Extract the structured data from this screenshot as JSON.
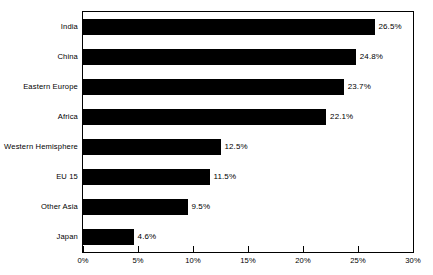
{
  "chart_data": {
    "type": "bar",
    "orientation": "horizontal",
    "title": "",
    "xlabel": "",
    "ylabel": "",
    "xlim": [
      0,
      30
    ],
    "xticks": [
      "0%",
      "5%",
      "10%",
      "15%",
      "20%",
      "25%",
      "30%"
    ],
    "xtick_values": [
      0,
      5,
      10,
      15,
      20,
      25,
      30
    ],
    "grid": false,
    "legend": null,
    "bar_color": "#000000",
    "frame_color": "#000000",
    "background": "#ffffff",
    "categories": [
      "India",
      "China",
      "Eastern Europe",
      "Africa",
      "Western Hemisphere",
      "EU 15",
      "Other Asia",
      "Japan"
    ],
    "values": [
      26.5,
      24.8,
      23.7,
      22.1,
      12.5,
      11.5,
      9.5,
      4.6
    ],
    "data_labels": [
      "26.5%",
      "24.8%",
      "23.7%",
      "22.1%",
      "12.5%",
      "11.5%",
      "9.5%",
      "4.6%"
    ]
  },
  "title_remnant": ""
}
